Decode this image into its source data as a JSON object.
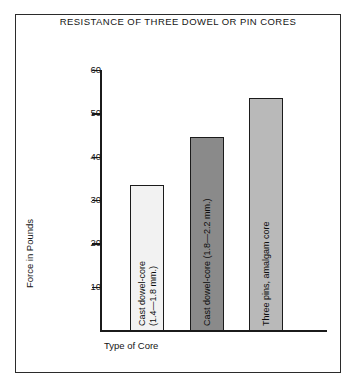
{
  "chart_data": {
    "type": "bar",
    "title": "RESISTANCE OF THREE DOWEL OR PIN CORES",
    "xlabel": "Type of Core",
    "ylabel": "Force in Pounds",
    "ylim": [
      0,
      60
    ],
    "yticks": [
      10,
      20,
      30,
      40,
      50,
      60
    ],
    "grid": false,
    "legend": "none",
    "categories": [
      "Cast dowel-core (1.4—1.8 mm.)",
      "Cast dowel-core (1.8—2.2 mm.)",
      "Three pins, amalgam core"
    ],
    "values": [
      33.5,
      44.5,
      53.5
    ],
    "bar_colors": [
      "#f2f2f2",
      "#8a8a8a",
      "#b9b9b9"
    ],
    "bar_label_lines": [
      [
        "Cast dowel-core",
        "(1.4—1.8 mm.)"
      ],
      [
        "Cast dowel-core (1.8—2.2 mm.)"
      ],
      [
        "Three pins, amalgam core"
      ]
    ]
  },
  "frame": {
    "border_color": "#2b2b2b"
  }
}
